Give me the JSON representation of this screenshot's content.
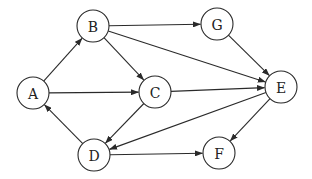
{
  "diagram": {
    "type": "directed-graph",
    "node_radius": 16,
    "colors": {
      "stroke": "#2a2a2a",
      "fill": "#ffffff",
      "text": "#222222"
    },
    "nodes": [
      {
        "id": "A",
        "label": "A",
        "x": 33,
        "y": 93
      },
      {
        "id": "B",
        "label": "B",
        "x": 93,
        "y": 26
      },
      {
        "id": "C",
        "label": "C",
        "x": 155,
        "y": 92
      },
      {
        "id": "D",
        "label": "D",
        "x": 94,
        "y": 155
      },
      {
        "id": "E",
        "label": "E",
        "x": 281,
        "y": 87
      },
      {
        "id": "F",
        "label": "F",
        "x": 219,
        "y": 153
      },
      {
        "id": "G",
        "label": "G",
        "x": 217,
        "y": 24
      }
    ],
    "edges": [
      {
        "from": "A",
        "to": "B"
      },
      {
        "from": "A",
        "to": "C"
      },
      {
        "from": "B",
        "to": "G"
      },
      {
        "from": "B",
        "to": "E"
      },
      {
        "from": "B",
        "to": "C"
      },
      {
        "from": "G",
        "to": "E"
      },
      {
        "from": "C",
        "to": "E"
      },
      {
        "from": "C",
        "to": "D"
      },
      {
        "from": "E",
        "to": "D"
      },
      {
        "from": "E",
        "to": "F"
      },
      {
        "from": "D",
        "to": "A"
      },
      {
        "from": "D",
        "to": "F"
      }
    ]
  }
}
